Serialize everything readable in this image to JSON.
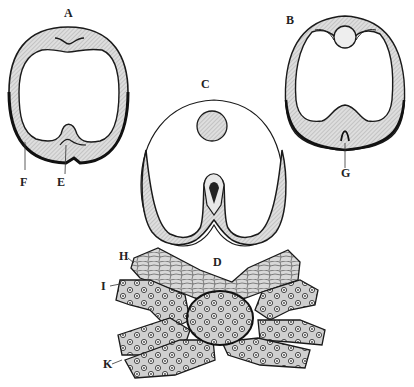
{
  "figure": {
    "colors": {
      "ink": "#1a1a1a",
      "shade": "#c9c9c9",
      "paper": "#ffffff"
    },
    "panels": [
      {
        "id": "A",
        "label": "A",
        "desc": "Oval ring section with dorsal and ventral infolding"
      },
      {
        "id": "B",
        "label": "B",
        "desc": "Section with dorsal round body and ventral groove"
      },
      {
        "id": "C",
        "label": "C",
        "desc": "Section with round disc and deep ventral fold forming tube"
      },
      {
        "id": "D",
        "label": "D",
        "desc": "Cellular tissue section with central mass and radiating cell bands"
      }
    ],
    "annotations": [
      {
        "id": "A",
        "text": "A"
      },
      {
        "id": "B",
        "text": "B"
      },
      {
        "id": "C",
        "text": "C"
      },
      {
        "id": "D",
        "text": "D"
      },
      {
        "id": "E",
        "text": "E"
      },
      {
        "id": "F",
        "text": "F"
      },
      {
        "id": "G",
        "text": "G"
      },
      {
        "id": "H",
        "text": "H"
      },
      {
        "id": "I",
        "text": "I"
      },
      {
        "id": "K",
        "text": "K"
      }
    ]
  }
}
